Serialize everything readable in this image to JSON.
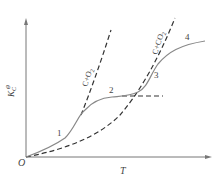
{
  "diagram": {
    "y_axis_label": "K",
    "y_axis_subscript": "C",
    "y_axis_superscript": "⊖",
    "x_axis_label": "T",
    "origin_label": "O",
    "line_labels": {
      "c_o2": "C+O",
      "c_o2_sub": "2",
      "c_co2": "C+CO",
      "c_co2_sub": "2"
    },
    "point_labels": [
      "1",
      "2",
      "3",
      "4"
    ],
    "colors": {
      "axis": "#777777",
      "solid_curve": "#888888",
      "dashed_curve": "#333333",
      "text": "#444444"
    }
  }
}
